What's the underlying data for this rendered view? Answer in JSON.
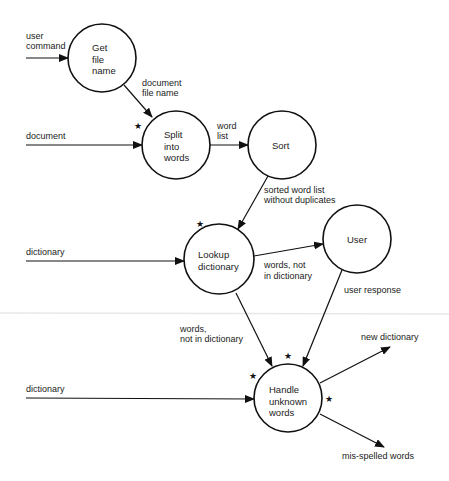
{
  "diagram": {
    "type": "data-flow-diagram",
    "processes": [
      {
        "id": "get_file_name",
        "label": "Get\nfile\nname",
        "cx": 102,
        "cy": 58,
        "r": 34,
        "starred": false
      },
      {
        "id": "split_into_words",
        "label": "Split\ninto\nwords",
        "cx": 176,
        "cy": 145,
        "r": 34,
        "starred": true
      },
      {
        "id": "sort",
        "label": "Sort",
        "cx": 282,
        "cy": 145,
        "r": 34,
        "starred": false
      },
      {
        "id": "lookup_dictionary",
        "label": "Lookup\ndictionary",
        "cx": 219,
        "cy": 259,
        "r": 35,
        "starred": true
      },
      {
        "id": "user",
        "label": "User",
        "cx": 357,
        "cy": 239,
        "r": 34,
        "starred": false
      },
      {
        "id": "handle_unknown_words",
        "label": "Handle\nunknown\nwords",
        "cx": 288,
        "cy": 398,
        "r": 34,
        "starred": true
      }
    ],
    "flows": [
      {
        "from": "external",
        "to": "get_file_name",
        "label": "user\ncommand"
      },
      {
        "from": "get_file_name",
        "to": "split_into_words",
        "label": "document\nfile name"
      },
      {
        "from": "external",
        "to": "split_into_words",
        "label": "document"
      },
      {
        "from": "split_into_words",
        "to": "sort",
        "label": "word\nlist"
      },
      {
        "from": "sort",
        "to": "lookup_dictionary",
        "label": "sorted word list\nwithout duplicates"
      },
      {
        "from": "external",
        "to": "lookup_dictionary",
        "label": "dictionary"
      },
      {
        "from": "lookup_dictionary",
        "to": "user",
        "label": "words, not\nin dictionary"
      },
      {
        "from": "user",
        "to": "handle_unknown_words",
        "label": "user response"
      },
      {
        "from": "lookup_dictionary",
        "to": "handle_unknown_words",
        "label": "words,\nnot in dictionary"
      },
      {
        "from": "external",
        "to": "handle_unknown_words",
        "label": "dictionary"
      },
      {
        "from": "handle_unknown_words",
        "to": "external",
        "label": "new dictionary"
      },
      {
        "from": "handle_unknown_words",
        "to": "external",
        "label": "mis-spelled words"
      }
    ],
    "star_symbol": "★",
    "colors": {
      "stroke": "#111111",
      "background": "#ffffff",
      "artifact_line": "#e6e6e6"
    }
  },
  "nodes": {
    "get_file_name": "Get\nfile\nname",
    "split_into_words": "Split\ninto\nwords",
    "sort": "Sort",
    "lookup_dictionary": "Lookup\ndictionary",
    "user": "User",
    "handle_unknown_words": "Handle\nunknown\nwords"
  },
  "labels": {
    "user_command_1": "user",
    "user_command_2": "command",
    "document_file_name_1": "document",
    "document_file_name_2": "file name",
    "document": "document",
    "word_list_1": "word",
    "word_list_2": "list",
    "sorted_1": "sorted word list",
    "sorted_2": "without duplicates",
    "dictionary_1": "dictionary",
    "words_not_in_dict_1": "words, not",
    "words_not_in_dict_2": "in dictionary",
    "user_response": "user response",
    "words_not_in_dict_b1": "words,",
    "words_not_in_dict_b2": "not in dictionary",
    "dictionary_2": "dictionary",
    "new_dictionary": "new dictionary",
    "misspelled_words": "mis-spelled words"
  },
  "star": "★"
}
